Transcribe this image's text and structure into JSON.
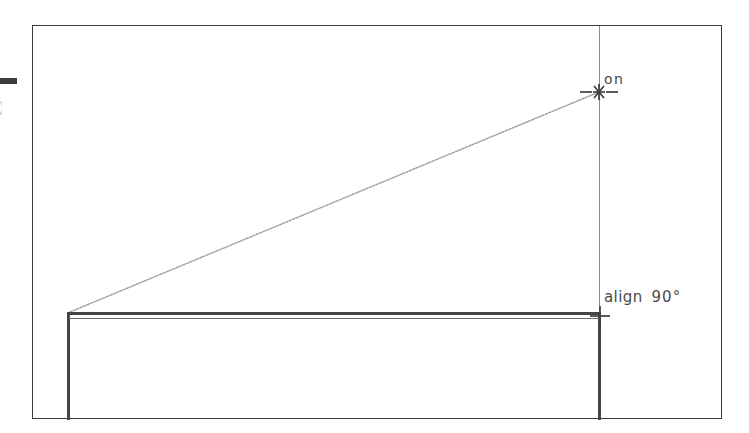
{
  "app": {
    "kind": "cad-drawing-canvas",
    "background_color": "#ffffff",
    "canvas_width": 749,
    "canvas_height": 433
  },
  "sheet": {
    "frame_name": "drawing-sheet-border",
    "frame_color": "#3b3b3b",
    "left": 32,
    "top": 25,
    "width": 690,
    "height": 394
  },
  "geometry": {
    "rectangle": {
      "label": "rectangle-entity",
      "color": "#454545",
      "left": 67,
      "top": 312,
      "width": 534,
      "height": 108
    },
    "construction_line": {
      "label": "vertical-extension-line",
      "color": "#8a8a8a",
      "x": 599,
      "y_start": 26,
      "y_end": 318
    },
    "rubber_band": {
      "label": "diagonal-rubber-band",
      "color": "#9a9a9a",
      "x1": 70,
      "y1": 312,
      "x2": 599,
      "y2": 92
    }
  },
  "snaps": [
    {
      "id": "snap-on",
      "marker": "asterisk-snap-icon",
      "label": "on",
      "x": 599,
      "y": 92,
      "color": "#4a4a4a"
    },
    {
      "id": "snap-align",
      "marker": "cross-snap-icon",
      "label_prefix": "align",
      "label_value": "90°",
      "x": 600,
      "y": 316,
      "color": "#4a4a4a"
    }
  ],
  "margin_artifacts": {
    "dash": "clipped-horizontal-dash",
    "glyph": "0"
  }
}
